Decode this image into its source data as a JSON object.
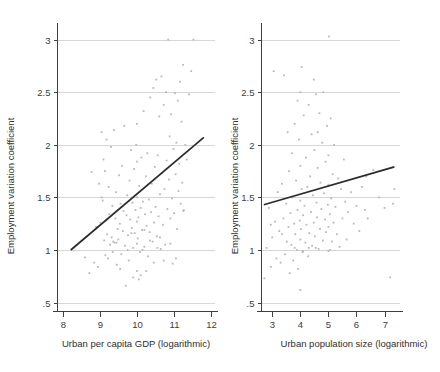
{
  "figure": {
    "background": "#ffffff",
    "point_color": "#b9b9b9",
    "line_color": "#2b2b2b",
    "grid_color": "#d6d6d6",
    "axis_color": "#3f3f3f",
    "width": 440,
    "height": 372
  },
  "chart_data": [
    {
      "type": "scatter",
      "panel": "left",
      "title": "",
      "xlabel": "Urban per capita GDP (logarithmic)",
      "ylabel": "Employment variation coefficient",
      "xlim": [
        7.85,
        12.1
      ],
      "ylim": [
        0.42,
        3.12
      ],
      "xticks": [
        8,
        9,
        10,
        11,
        12
      ],
      "xticklabels": [
        "8",
        "9",
        "10",
        "11",
        "12"
      ],
      "yticks": [
        0.5,
        1,
        1.5,
        2,
        2.5,
        3
      ],
      "yticklabels": [
        ".5",
        "1",
        "1.5",
        "2",
        "2.5",
        "3"
      ],
      "grid": "horizontal",
      "legend": "none",
      "fit_line": {
        "x": [
          8.22,
          11.8
        ],
        "y": [
          1.0,
          2.07
        ],
        "slope": 0.299,
        "intercept": -1.458
      },
      "points": [
        [
          8.6,
          0.93
        ],
        [
          8.72,
          0.78
        ],
        [
          8.78,
          1.74
        ],
        [
          8.85,
          0.88
        ],
        [
          8.9,
          1.22
        ],
        [
          8.95,
          0.84
        ],
        [
          9.02,
          1.26
        ],
        [
          9.05,
          2.12
        ],
        [
          9.08,
          1.47
        ],
        [
          9.1,
          1.86
        ],
        [
          9.12,
          1.09
        ],
        [
          9.14,
          1.75
        ],
        [
          9.16,
          1.28
        ],
        [
          9.18,
          2.05
        ],
        [
          9.2,
          1.15
        ],
        [
          9.22,
          0.92
        ],
        [
          9.24,
          1.6
        ],
        [
          9.26,
          1.34
        ],
        [
          9.28,
          1.05
        ],
        [
          9.3,
          1.98
        ],
        [
          9.32,
          1.12
        ],
        [
          9.34,
          1.42
        ],
        [
          9.36,
          1.08
        ],
        [
          9.38,
          2.14
        ],
        [
          9.4,
          1.07
        ],
        [
          9.42,
          1.3
        ],
        [
          9.44,
          1.55
        ],
        [
          9.46,
          0.86
        ],
        [
          9.48,
          1.2
        ],
        [
          9.5,
          1.1
        ],
        [
          9.52,
          1.71
        ],
        [
          9.54,
          1.25
        ],
        [
          9.56,
          1.44
        ],
        [
          9.58,
          0.96
        ],
        [
          9.6,
          1.8
        ],
        [
          9.62,
          1.18
        ],
        [
          9.64,
          1.37
        ],
        [
          9.66,
          2.18
        ],
        [
          9.68,
          1.04
        ],
        [
          9.7,
          0.66
        ],
        [
          9.72,
          1.33
        ],
        [
          9.74,
          1.52
        ],
        [
          9.76,
          1.14
        ],
        [
          9.78,
          0.9
        ],
        [
          9.8,
          1.66
        ],
        [
          9.82,
          1.29
        ],
        [
          9.84,
          1.95
        ],
        [
          9.86,
          1.21
        ],
        [
          9.88,
          1.45
        ],
        [
          9.9,
          1.02
        ],
        [
          9.92,
          1.77
        ],
        [
          9.94,
          1.16
        ],
        [
          9.96,
          1.38
        ],
        [
          9.98,
          2.0
        ],
        [
          10.0,
          0.8
        ],
        [
          10.0,
          1.06
        ],
        [
          10.0,
          1.27
        ],
        [
          10.0,
          1.5
        ],
        [
          10.0,
          1.84
        ],
        [
          10.0,
          2.2
        ],
        [
          10.02,
          1.11
        ],
        [
          10.04,
          1.31
        ],
        [
          10.06,
          1.61
        ],
        [
          10.08,
          0.98
        ],
        [
          10.1,
          1.4
        ],
        [
          10.12,
          1.88
        ],
        [
          10.14,
          1.19
        ],
        [
          10.16,
          1.46
        ],
        [
          10.18,
          2.32
        ],
        [
          10.2,
          1.03
        ],
        [
          10.22,
          1.34
        ],
        [
          10.24,
          1.7
        ],
        [
          10.26,
          1.23
        ],
        [
          10.28,
          1.92
        ],
        [
          10.3,
          0.94
        ],
        [
          10.32,
          1.48
        ],
        [
          10.34,
          1.17
        ],
        [
          10.36,
          2.45
        ],
        [
          10.38,
          1.36
        ],
        [
          10.4,
          1.63
        ],
        [
          10.42,
          1.08
        ],
        [
          10.44,
          2.54
        ],
        [
          10.46,
          1.26
        ],
        [
          10.48,
          1.79
        ],
        [
          10.5,
          1.41
        ],
        [
          10.52,
          2.62
        ],
        [
          10.54,
          1.13
        ],
        [
          10.56,
          1.9
        ],
        [
          10.58,
          1.32
        ],
        [
          10.6,
          2.27
        ],
        [
          10.62,
          1.53
        ],
        [
          10.64,
          1.01
        ],
        [
          10.66,
          2.65
        ],
        [
          10.68,
          1.73
        ],
        [
          10.7,
          1.24
        ],
        [
          10.72,
          2.38
        ],
        [
          10.74,
          1.58
        ],
        [
          10.76,
          1.05
        ],
        [
          10.78,
          2.5
        ],
        [
          10.8,
          1.85
        ],
        [
          10.82,
          1.39
        ],
        [
          10.84,
          3.0
        ],
        [
          10.86,
          1.67
        ],
        [
          10.88,
          2.08
        ],
        [
          10.9,
          1.3
        ],
        [
          10.92,
          2.29
        ],
        [
          10.94,
          1.49
        ],
        [
          10.96,
          0.87
        ],
        [
          10.98,
          1.96
        ],
        [
          11.0,
          1.35
        ],
        [
          11.02,
          2.49
        ],
        [
          11.04,
          1.72
        ],
        [
          11.06,
          2.02
        ],
        [
          11.08,
          1.2
        ],
        [
          11.1,
          2.42
        ],
        [
          11.12,
          1.56
        ],
        [
          11.14,
          1.82
        ],
        [
          11.16,
          2.6
        ],
        [
          11.18,
          1.44
        ],
        [
          11.2,
          2.22
        ],
        [
          11.22,
          1.64
        ],
        [
          11.24,
          2.76
        ],
        [
          11.26,
          1.38
        ],
        [
          11.3,
          2.0
        ],
        [
          11.34,
          1.86
        ],
        [
          11.4,
          2.48
        ],
        [
          11.46,
          2.7
        ],
        [
          11.52,
          3.0
        ],
        [
          11.25,
          1.37
        ],
        [
          9.05,
          1.5
        ],
        [
          8.98,
          1.63
        ],
        [
          9.15,
          0.95
        ],
        [
          10.05,
          0.72
        ],
        [
          10.1,
          0.76
        ],
        [
          10.25,
          0.8
        ],
        [
          9.9,
          0.74
        ],
        [
          9.55,
          0.82
        ],
        [
          10.45,
          0.88
        ],
        [
          10.72,
          0.9
        ],
        [
          11.05,
          0.92
        ],
        [
          9.35,
          0.98
        ],
        [
          9.75,
          1.0
        ],
        [
          10.15,
          1.0
        ],
        [
          10.55,
          1.02
        ],
        [
          10.9,
          1.06
        ],
        [
          9.45,
          1.07
        ],
        [
          10.35,
          1.09
        ],
        [
          10.62,
          1.12
        ],
        [
          9.85,
          1.16
        ],
        [
          10.2,
          1.19
        ]
      ]
    },
    {
      "type": "scatter",
      "panel": "right",
      "title": "",
      "xlabel": "Urban population size (logarithmic)",
      "ylabel": "Employment variation coefficient",
      "xlim": [
        2.6,
        7.55
      ],
      "ylim": [
        0.42,
        3.12
      ],
      "xticks": [
        3,
        4,
        5,
        6,
        7
      ],
      "xticklabels": [
        "3",
        "4",
        "5",
        "6",
        "7"
      ],
      "yticks": [
        0.5,
        1,
        1.5,
        2,
        2.5,
        3
      ],
      "yticklabels": [
        ".5",
        "1",
        "1.5",
        "2",
        "2.5",
        "3"
      ],
      "grid": "horizontal",
      "legend": "none",
      "fit_line": {
        "x": [
          2.7,
          7.35
        ],
        "y": [
          1.43,
          1.79
        ],
        "slope": 0.0774,
        "intercept": 1.221
      },
      "points": [
        [
          2.72,
          0.73
        ],
        [
          2.8,
          1.02
        ],
        [
          2.88,
          1.4
        ],
        [
          2.95,
          0.84
        ],
        [
          3.0,
          1.12
        ],
        [
          3.05,
          2.7
        ],
        [
          3.1,
          1.27
        ],
        [
          3.15,
          0.92
        ],
        [
          3.2,
          1.55
        ],
        [
          3.25,
          1.18
        ],
        [
          3.3,
          0.88
        ],
        [
          3.35,
          1.63
        ],
        [
          3.4,
          1.3
        ],
        [
          3.45,
          0.96
        ],
        [
          3.5,
          1.44
        ],
        [
          3.52,
          1.08
        ],
        [
          3.55,
          2.12
        ],
        [
          3.58,
          1.22
        ],
        [
          3.6,
          1.75
        ],
        [
          3.62,
          0.78
        ],
        [
          3.65,
          1.35
        ],
        [
          3.68,
          1.05
        ],
        [
          3.7,
          1.92
        ],
        [
          3.72,
          1.5
        ],
        [
          3.75,
          0.9
        ],
        [
          3.78,
          1.25
        ],
        [
          3.8,
          2.2
        ],
        [
          3.82,
          1.15
        ],
        [
          3.85,
          1.66
        ],
        [
          3.88,
          1.0
        ],
        [
          3.9,
          1.38
        ],
        [
          3.92,
          0.82
        ],
        [
          3.95,
          2.05
        ],
        [
          3.98,
          1.28
        ],
        [
          4.0,
          0.62
        ],
        [
          4.0,
          1.1
        ],
        [
          4.0,
          1.47
        ],
        [
          4.0,
          1.8
        ],
        [
          4.0,
          2.5
        ],
        [
          4.02,
          1.2
        ],
        [
          4.05,
          1.58
        ],
        [
          4.08,
          0.98
        ],
        [
          4.1,
          1.33
        ],
        [
          4.12,
          2.28
        ],
        [
          4.15,
          1.42
        ],
        [
          4.18,
          1.07
        ],
        [
          4.2,
          1.88
        ],
        [
          4.22,
          1.24
        ],
        [
          4.25,
          1.6
        ],
        [
          4.28,
          0.94
        ],
        [
          4.3,
          2.38
        ],
        [
          4.32,
          1.16
        ],
        [
          4.35,
          1.7
        ],
        [
          4.38,
          1.36
        ],
        [
          4.4,
          2.1
        ],
        [
          4.42,
          1.04
        ],
        [
          4.45,
          1.52
        ],
        [
          4.48,
          1.26
        ],
        [
          4.5,
          1.95
        ],
        [
          4.52,
          1.13
        ],
        [
          4.55,
          2.48
        ],
        [
          4.58,
          1.45
        ],
        [
          4.6,
          1.31
        ],
        [
          4.62,
          1.78
        ],
        [
          4.65,
          1.01
        ],
        [
          4.68,
          2.3
        ],
        [
          4.7,
          1.2
        ],
        [
          4.72,
          1.64
        ],
        [
          4.75,
          1.39
        ],
        [
          4.78,
          2.02
        ],
        [
          4.8,
          1.09
        ],
        [
          4.82,
          2.5
        ],
        [
          4.85,
          1.54
        ],
        [
          4.88,
          1.29
        ],
        [
          4.9,
          1.84
        ],
        [
          4.92,
          1.17
        ],
        [
          4.95,
          2.18
        ],
        [
          4.98,
          1.43
        ],
        [
          5.0,
          0.99
        ],
        [
          5.0,
          1.22
        ],
        [
          5.0,
          1.62
        ],
        [
          5.0,
          1.9
        ],
        [
          5.02,
          3.03
        ],
        [
          5.05,
          1.34
        ],
        [
          5.08,
          2.25
        ],
        [
          5.1,
          1.49
        ],
        [
          5.12,
          1.08
        ],
        [
          5.15,
          1.72
        ],
        [
          5.18,
          1.26
        ],
        [
          5.2,
          2.0
        ],
        [
          5.25,
          1.41
        ],
        [
          5.3,
          1.15
        ],
        [
          5.35,
          1.68
        ],
        [
          5.4,
          1.03
        ],
        [
          5.45,
          1.58
        ],
        [
          5.5,
          1.3
        ],
        [
          5.55,
          1.86
        ],
        [
          5.6,
          1.46
        ],
        [
          5.65,
          1.1
        ],
        [
          5.7,
          1.36
        ],
        [
          5.8,
          1.55
        ],
        [
          5.9,
          1.25
        ],
        [
          6.0,
          1.42
        ],
        [
          6.1,
          1.18
        ],
        [
          6.2,
          1.6
        ],
        [
          6.3,
          1.38
        ],
        [
          6.35,
          1.7
        ],
        [
          6.4,
          1.3
        ],
        [
          6.6,
          1.76
        ],
        [
          6.8,
          1.5
        ],
        [
          7.0,
          1.4
        ],
        [
          7.2,
          0.74
        ],
        [
          7.3,
          1.44
        ],
        [
          7.35,
          1.58
        ],
        [
          3.42,
          2.66
        ],
        [
          4.05,
          2.74
        ],
        [
          4.48,
          2.62
        ],
        [
          3.9,
          2.42
        ],
        [
          4.62,
          2.12
        ],
        [
          4.3,
          1.02
        ],
        [
          3.8,
          1.02
        ],
        [
          4.1,
          0.99
        ],
        [
          4.55,
          1.02
        ],
        [
          5.05,
          1.0
        ],
        [
          3.35,
          1.15
        ],
        [
          2.95,
          1.24
        ]
      ]
    }
  ]
}
